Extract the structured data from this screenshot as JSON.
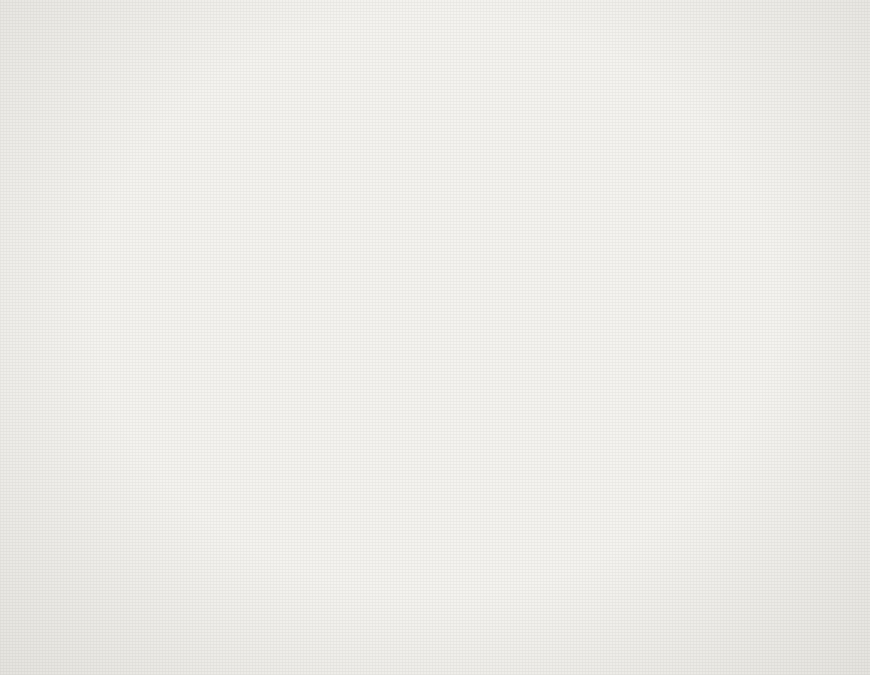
{
  "figure": {
    "background_color": "#f4f3ef",
    "bar_fill_color": "#6e6e6e",
    "axis_color": "#3a3a3a"
  },
  "panels": {
    "top": {
      "name": "earthquake-frequency-panel",
      "ylabel": "earthquakes/month",
      "annotation": "earthquake frequency"
    },
    "bottom": {
      "name": "waste-injection-panel",
      "ylabel": "millions of gallons/month",
      "annotation": "contaminated waste injected",
      "arrow_annotation": "no fluid injected"
    }
  },
  "xaxis": {
    "year_labels": [
      "1962",
      "1963",
      "1964",
      "1965"
    ],
    "year_boundaries": [
      "1963",
      "1964",
      "1965"
    ]
  },
  "chart_data": [
    {
      "type": "bar",
      "name": "earthquake-frequency",
      "title": "earthquake frequency",
      "xlabel": "",
      "ylabel": "earthquakes/month",
      "ylim": [
        0,
        90
      ],
      "yticks": [
        0,
        20,
        40,
        60,
        80
      ],
      "yticks_minor": [
        10,
        30,
        50,
        70
      ],
      "grid": "year-boundary-verticals",
      "x_start_month": "1962-03",
      "categories": [
        "1962-03",
        "1962-04",
        "1962-05",
        "1962-06",
        "1962-07",
        "1962-08",
        "1962-09",
        "1962-10",
        "1962-11",
        "1962-12",
        "1963-01",
        "1963-02",
        "1963-03",
        "1963-04",
        "1963-05",
        "1963-06",
        "1963-07",
        "1963-08",
        "1963-09",
        "1963-10",
        "1963-11",
        "1963-12",
        "1964-01",
        "1964-02",
        "1964-03",
        "1964-04",
        "1964-05",
        "1964-06",
        "1964-07",
        "1964-08",
        "1964-09",
        "1964-10",
        "1964-11",
        "1964-12",
        "1965-01",
        "1965-02",
        "1965-03",
        "1965-04",
        "1965-05",
        "1965-06",
        "1965-07",
        "1965-08",
        "1965-09"
      ],
      "values": [
        3,
        14,
        34,
        23,
        22,
        29,
        24,
        8,
        4,
        20,
        25,
        22,
        21,
        41,
        20,
        20,
        9,
        6,
        10,
        11,
        8,
        5,
        4,
        3,
        9,
        9,
        5,
        4,
        4,
        6,
        3,
        13,
        8,
        7,
        29,
        9,
        18,
        11,
        22,
        37,
        61,
        47,
        86
      ],
      "last_value_after_peak": 5
    },
    {
      "type": "bar",
      "name": "contaminated-waste-injected",
      "title": "contaminated waste injected",
      "xlabel": "",
      "ylabel": "millions of gallons/month",
      "ylim": [
        0,
        9
      ],
      "yticks": [
        0,
        2,
        4,
        6,
        8
      ],
      "yticks_minor": [
        1,
        3,
        5,
        7
      ],
      "grid": "year-boundary-verticals",
      "x_start_month": "1962-03",
      "categories": [
        "1962-03",
        "1962-04",
        "1962-05",
        "1962-06",
        "1962-07",
        "1962-08",
        "1962-09",
        "1962-10",
        "1962-11",
        "1962-12",
        "1963-01",
        "1963-02",
        "1963-03",
        "1963-04",
        "1963-05",
        "1963-06",
        "1963-07",
        "1963-08",
        "1963-09",
        "1963-10",
        "1963-11",
        "1963-12",
        "1964-01",
        "1964-02",
        "1964-03",
        "1964-04",
        "1964-05",
        "1964-06",
        "1964-07",
        "1964-08",
        "1964-09",
        "1964-10",
        "1964-11",
        "1964-12",
        "1965-01",
        "1965-02",
        "1965-03",
        "1965-04",
        "1965-05",
        "1965-06",
        "1965-07",
        "1965-08",
        "1965-09"
      ],
      "values": [
        3.9,
        3.9,
        6.95,
        8.1,
        7.8,
        5.1,
        5.85,
        4.85,
        5.55,
        3.9,
        3.4,
        5.9,
        5.9,
        7.4,
        7.6,
        6.25,
        3.45,
        3.85,
        3.35,
        2.4,
        3.9,
        0,
        0,
        0,
        0,
        0,
        0,
        0,
        0,
        0,
        0,
        0,
        0,
        0.5,
        1.7,
        2.3,
        1.9,
        1.9,
        1.45,
        3.45,
        5.4,
        9.2,
        6.4
      ]
    }
  ]
}
